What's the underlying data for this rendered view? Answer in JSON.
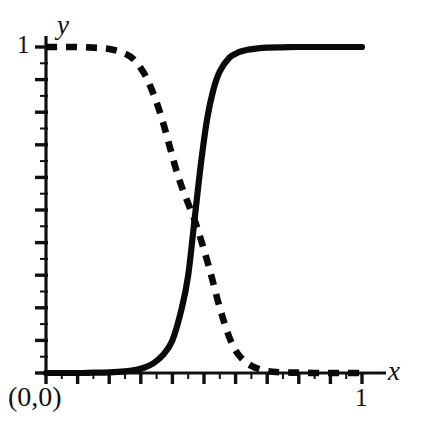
{
  "figure": {
    "width": 424,
    "height": 423,
    "background": "#ffffff",
    "ink_color": "#0a0a0a"
  },
  "labels": {
    "x_axis_name": "x",
    "y_axis_name": "y",
    "x_max_tick": "1",
    "y_max_tick": "1",
    "origin": "(0,0)"
  },
  "chart_data": {
    "type": "line",
    "title": "",
    "xlabel": "x",
    "ylabel": "y",
    "xlim": [
      0,
      1
    ],
    "ylim": [
      0,
      1
    ],
    "grid": false,
    "legend": "none",
    "xticks": [
      0,
      0.1,
      0.2,
      0.3,
      0.4,
      0.5,
      0.6,
      0.7,
      0.8,
      0.9,
      1
    ],
    "xtick_labels": [
      "(0,0)",
      "",
      "",
      "",
      "",
      "",
      "",
      "",
      "",
      "",
      "1"
    ],
    "xminor_ticks": [
      0.05,
      0.15,
      0.25,
      0.35,
      0.45,
      0.55,
      0.65,
      0.75,
      0.85,
      0.95
    ],
    "yticks": [
      0,
      0.1,
      0.2,
      0.3,
      0.4,
      0.5,
      0.6,
      0.7,
      0.8,
      0.9,
      1
    ],
    "ytick_labels": [
      "",
      "",
      "",
      "",
      "",
      "",
      "",
      "",
      "",
      "",
      "1"
    ],
    "yminor_ticks": [
      0.05,
      0.15,
      0.25,
      0.35,
      0.45,
      0.55,
      0.65,
      0.75,
      0.85,
      0.95
    ],
    "crossing_point": [
      0.47,
      0.5
    ],
    "series": [
      {
        "name": "increasing-sigmoid",
        "style": "solid",
        "x": [
          0.0,
          0.05,
          0.1,
          0.15,
          0.2,
          0.25,
          0.28,
          0.31,
          0.34,
          0.37,
          0.4,
          0.43,
          0.45,
          0.47,
          0.49,
          0.51,
          0.53,
          0.55,
          0.58,
          0.61,
          0.64,
          0.67,
          0.7,
          0.75,
          0.8,
          0.85,
          0.9,
          0.95,
          1.0
        ],
        "y": [
          0.0,
          0.0,
          0.0,
          0.001,
          0.002,
          0.005,
          0.009,
          0.016,
          0.03,
          0.055,
          0.1,
          0.2,
          0.3,
          0.47,
          0.64,
          0.78,
          0.87,
          0.925,
          0.967,
          0.984,
          0.992,
          0.996,
          0.998,
          0.999,
          1.0,
          1.0,
          1.0,
          1.0,
          1.0
        ]
      },
      {
        "name": "decreasing-sigmoid",
        "style": "dashed",
        "x": [
          0.0,
          0.05,
          0.1,
          0.15,
          0.2,
          0.25,
          0.28,
          0.31,
          0.33,
          0.35,
          0.37,
          0.39,
          0.41,
          0.43,
          0.45,
          0.47,
          0.49,
          0.52,
          0.55,
          0.58,
          0.61,
          0.65,
          0.7,
          0.75,
          0.8,
          0.85,
          0.9,
          0.95,
          1.0
        ],
        "y": [
          1.0,
          1.0,
          1.0,
          0.998,
          0.994,
          0.98,
          0.96,
          0.92,
          0.88,
          0.83,
          0.77,
          0.7,
          0.63,
          0.57,
          0.52,
          0.47,
          0.41,
          0.31,
          0.2,
          0.11,
          0.055,
          0.022,
          0.006,
          0.002,
          0.001,
          0.0,
          0.0,
          0.0,
          0.0
        ]
      }
    ]
  }
}
